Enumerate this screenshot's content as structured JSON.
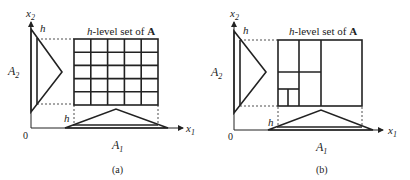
{
  "panels": [
    {
      "id": "a",
      "caption": "(a)",
      "title_prefix": "h",
      "title_rest": "-level set of ",
      "title_bold": "A",
      "axis_x": "x",
      "axis_x_sub": "1",
      "axis_y": "x",
      "axis_y_sub": "2",
      "origin": "0",
      "label_A1": "A",
      "label_A1_sub": "1",
      "label_A2": "A",
      "label_A2_sub": "2",
      "h_top": "h",
      "h_bottom": "h",
      "partition": "uniform 5x5 grid"
    },
    {
      "id": "b",
      "caption": "(b)",
      "title_prefix": "h",
      "title_rest": "-level set of ",
      "title_bold": "A",
      "axis_x": "x",
      "axis_x_sub": "1",
      "axis_y": "x",
      "axis_y_sub": "2",
      "origin": "0",
      "label_A1": "A",
      "label_A1_sub": "1",
      "label_A2": "A",
      "label_A2_sub": "2",
      "h_top": "h",
      "h_bottom": "h",
      "partition": "adaptive (nested) subdivision"
    }
  ],
  "colors": {
    "stroke": "#222222",
    "background": "#ffffff"
  }
}
